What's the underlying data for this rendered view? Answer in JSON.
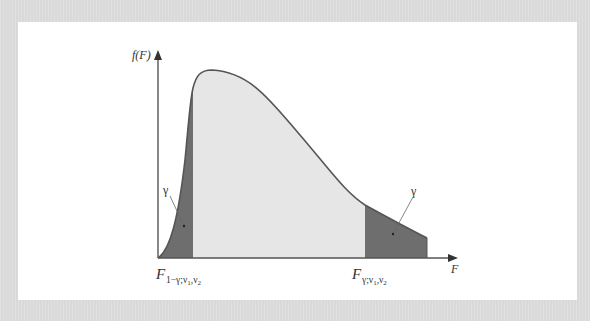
{
  "header": {
    "caption_fragment": ""
  },
  "diagram": {
    "y_axis_label": "f(F)",
    "x_axis_label": "F",
    "left_tail_label": "γ",
    "right_tail_label": "γ",
    "left_critical_value": {
      "base": "F",
      "subscript": "1−γ;ν",
      "sub1": "1",
      "mid": ",ν",
      "sub2": "2"
    },
    "right_critical_value": {
      "base": "F",
      "subscript": "γ;ν",
      "sub1": "1",
      "mid": ",ν",
      "sub2": "2"
    },
    "colors": {
      "panel_background": "#ffffff",
      "page_background": "#d9d9d9",
      "body_fill": "#e6e6e6",
      "tail_fill": "#6e6e6e",
      "curve_stroke": "#555555",
      "axis_stroke": "#555555"
    }
  }
}
